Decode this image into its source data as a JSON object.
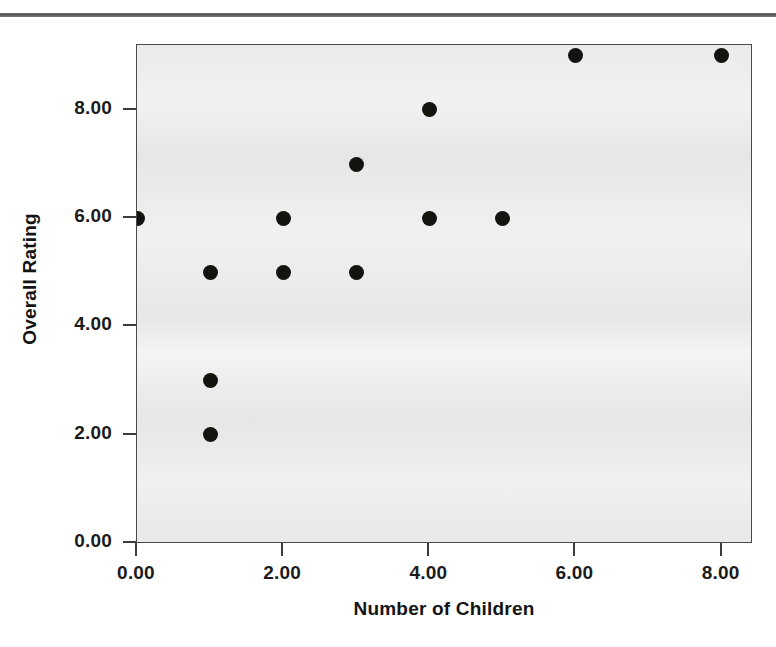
{
  "figure": {
    "background_color": "#ffffff",
    "plot_background_color": "#ebebeb",
    "frame_color": "#4a4a4a",
    "point_color": "#15130f",
    "top_rule_color": "#55565a"
  },
  "chart_data": {
    "type": "scatter",
    "title": "",
    "xlabel": "Number of Children",
    "ylabel": "Overall Rating",
    "xlim": [
      0,
      8.43
    ],
    "ylim": [
      -0.02,
      9.2
    ],
    "xticks": [
      0,
      2,
      4,
      6,
      8
    ],
    "yticks": [
      0,
      2,
      4,
      6,
      8
    ],
    "xticklabels": [
      "0.00",
      "2.00",
      "4.00",
      "6.00",
      "8.00"
    ],
    "yticklabels": [
      "0.00",
      "2.00",
      "4.00",
      "6.00",
      "8.00"
    ],
    "grid": false,
    "legend": false,
    "marker": "filled-circle",
    "marker_size": 15,
    "points": [
      {
        "x": 0,
        "y": 6
      },
      {
        "x": 1,
        "y": 5
      },
      {
        "x": 1,
        "y": 3
      },
      {
        "x": 1,
        "y": 2
      },
      {
        "x": 2,
        "y": 6
      },
      {
        "x": 2,
        "y": 5
      },
      {
        "x": 3,
        "y": 7
      },
      {
        "x": 3,
        "y": 5
      },
      {
        "x": 4,
        "y": 8
      },
      {
        "x": 4,
        "y": 6
      },
      {
        "x": 5,
        "y": 6
      },
      {
        "x": 6,
        "y": 9
      },
      {
        "x": 8,
        "y": 9
      }
    ]
  }
}
